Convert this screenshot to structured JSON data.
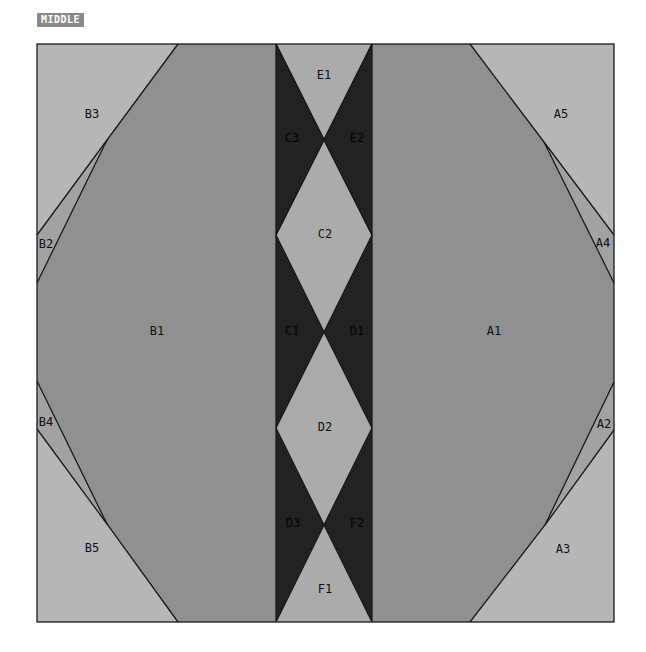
{
  "header": {
    "tag_label": "MIDDLE"
  },
  "colors": {
    "large_piece": "#909090",
    "corner_piece": "#b6b6b6",
    "dark_piece": "#222222",
    "light_diamond": "#ababab",
    "outline": "#1a1a1a"
  },
  "pieces": {
    "A1": "A1",
    "A2": "A2",
    "A3": "A3",
    "A4": "A4",
    "A5": "A5",
    "B1": "B1",
    "B2": "B2",
    "B3": "B3",
    "B4": "B4",
    "B5": "B5",
    "C1": "C1",
    "C2": "C2",
    "C3": "C3",
    "D1": "D1",
    "D2": "D2",
    "D3": "D3",
    "E1": "E1",
    "E2": "E2",
    "F1": "F1",
    "F2": "F2"
  }
}
